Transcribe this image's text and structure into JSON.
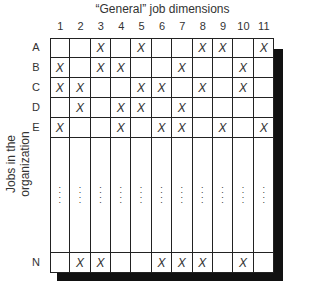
{
  "title": "“General” job dimensions",
  "y_axis_label": "Jobs in the organization",
  "columns": [
    "1",
    "2",
    "3",
    "4",
    "5",
    "6",
    "7",
    "8",
    "9",
    "10",
    "11"
  ],
  "rows": [
    {
      "label": "A",
      "marks": [
        3,
        5,
        8,
        9,
        11
      ]
    },
    {
      "label": "B",
      "marks": [
        1,
        3,
        4,
        7,
        10
      ]
    },
    {
      "label": "C",
      "marks": [
        1,
        2,
        5,
        6,
        8,
        10
      ]
    },
    {
      "label": "D",
      "marks": [
        2,
        4,
        5,
        7
      ]
    },
    {
      "label": "E",
      "marks": [
        1,
        4,
        6,
        7,
        9,
        11
      ]
    },
    {
      "label": "",
      "ellipsis": true
    },
    {
      "label": "N",
      "marks": [
        2,
        3,
        6,
        7,
        8,
        10
      ]
    }
  ],
  "mark_symbol": "X",
  "ellipsis_symbol": "⋮",
  "colors": {
    "line": "#222222",
    "shadow": "#111111",
    "background": "#ffffff"
  }
}
